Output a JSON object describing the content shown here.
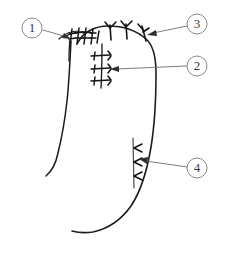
{
  "figure": {
    "background_color": "#ffffff",
    "ink_color": "#1c1c1c",
    "leader_color": "#6d6d6d",
    "callout_text_color": "#3a3a3a",
    "callout_circle_color": "#8c8c8c",
    "canvas": {
      "width": 225,
      "height": 259
    }
  },
  "callouts": [
    {
      "id": "callout-1",
      "label": "1",
      "circle": {
        "cx": 32,
        "cy": 28,
        "r": 10
      },
      "leader": {
        "x1": 42,
        "y1": 30,
        "x2": 67,
        "y2": 37
      },
      "arrow_tip": {
        "x": 70,
        "y": 38
      },
      "target": "left-ladder-suture-group"
    },
    {
      "id": "callout-2",
      "label": "2",
      "circle": {
        "cx": 197,
        "cy": 66,
        "r": 10
      },
      "leader": {
        "x1": 187,
        "y1": 66,
        "x2": 115,
        "y2": 69
      },
      "arrow_tip": {
        "x": 111,
        "y": 69
      },
      "target": "mid-ladder-suture-group"
    },
    {
      "id": "callout-3",
      "label": "3",
      "circle": {
        "cx": 197,
        "cy": 24,
        "r": 10
      },
      "leader": {
        "x1": 187,
        "y1": 26,
        "x2": 152,
        "y2": 34
      },
      "arrow_tip": {
        "x": 148,
        "y": 35
      },
      "target": "arc-barbed-suture-group"
    },
    {
      "id": "callout-4",
      "label": "4",
      "circle": {
        "cx": 197,
        "cy": 168,
        "r": 10
      },
      "leader": {
        "x1": 187,
        "y1": 167,
        "x2": 142,
        "y2": 160
      },
      "arrow_tip": {
        "x": 138,
        "y": 159
      },
      "target": "lower-barbed-suture-group"
    }
  ],
  "outline": {
    "left_contour": "M 71 41 C 70 62, 69 82, 67 100 C 65 118, 62 136, 58 152 C 56 162, 52 170, 46 175",
    "top_left_arc": "M 58 38 C 64 33, 72 31, 80 31",
    "top_arc": "M 76 43 C 82 32, 94 26, 107 26 C 122 26, 136 30, 145 38",
    "right_contour": "M 145 38 C 152 44, 155 56, 155 72 C 155 96, 154 122, 150 146 C 146 170, 140 190, 130 205 C 120 219, 106 228, 92 231 C 85 232, 79 232, 73 230",
    "inner_vertical": "M 71 41 C 70 50, 70 58, 70 62"
  },
  "suture_groups": [
    {
      "id": "left-ladder-suture-group",
      "name": "left-ladder-sutures",
      "kind": "ladder",
      "count": 5,
      "region": "upper-left rim"
    },
    {
      "id": "arc-barbed-suture-group",
      "name": "arc-barbed-sutures",
      "kind": "barbed-y",
      "count": 3,
      "region": "top arc"
    },
    {
      "id": "mid-ladder-suture-group",
      "name": "mid-ladder-sutures",
      "kind": "ladder",
      "count": 3,
      "region": "mid-left interior"
    },
    {
      "id": "lower-barbed-suture-group",
      "name": "lower-barbed-sutures",
      "kind": "barbed-y",
      "count": 3,
      "region": "lower-right interior"
    }
  ]
}
